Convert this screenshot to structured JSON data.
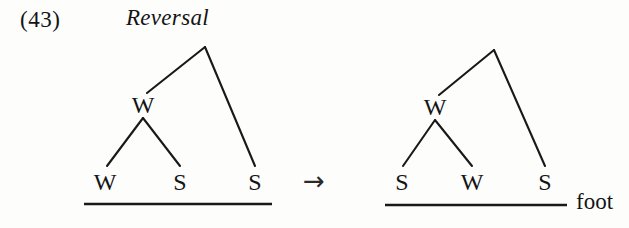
{
  "example": {
    "number": "(43)"
  },
  "rule": {
    "name": "Reversal",
    "arrow": "→",
    "arrow_icon": "rightwards-arrow-icon"
  },
  "foot": {
    "label": "foot"
  },
  "trees": {
    "input": {
      "root": {
        "label": "",
        "x": 205,
        "y": 47
      },
      "internal_nodes": [
        {
          "label": "W",
          "x": 143,
          "y": 105
        }
      ],
      "leaves": [
        {
          "label": "W",
          "x": 105,
          "y": 182
        },
        {
          "label": "S",
          "x": 180,
          "y": 182
        },
        {
          "label": "S",
          "x": 255,
          "y": 182
        }
      ],
      "baseline": {
        "x1": 84,
        "x2": 272,
        "y": 204
      }
    },
    "output": {
      "root": {
        "label": "",
        "x": 494,
        "y": 50
      },
      "internal_nodes": [
        {
          "label": "W",
          "x": 435,
          "y": 107
        }
      ],
      "leaves": [
        {
          "label": "S",
          "x": 402,
          "y": 182
        },
        {
          "label": "W",
          "x": 472,
          "y": 182
        },
        {
          "label": "S",
          "x": 545,
          "y": 182
        }
      ],
      "baseline": {
        "x1": 385,
        "x2": 567,
        "y": 205
      }
    }
  },
  "colors": {
    "ink": "#19191a",
    "page": "#fdfdfc"
  }
}
